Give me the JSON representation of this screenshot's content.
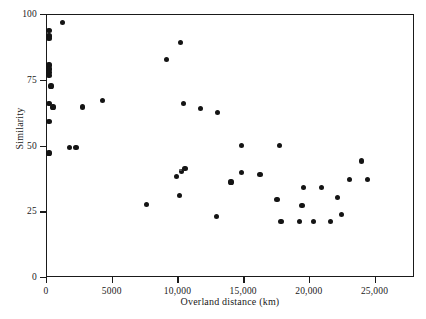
{
  "chart_data": {
    "type": "scatter",
    "title": "",
    "xlabel": "Overland distance (km)",
    "ylabel": "Similarity",
    "xlim": [
      0,
      28000
    ],
    "ylim": [
      0,
      100
    ],
    "grid": false,
    "legend": null,
    "xticks": [
      0,
      5000,
      10000,
      15000,
      20000,
      25000
    ],
    "xticklabels": [
      "0",
      "5000",
      "10,000",
      "15,000",
      "20,000",
      "25,000"
    ],
    "yticks": [
      0,
      25,
      50,
      75,
      100
    ],
    "yticklabels": [
      "0",
      "25",
      "50",
      "75",
      "100"
    ],
    "series": [
      {
        "name": "samples",
        "points": [
          [
            150,
            94.0
          ],
          [
            150,
            92.0
          ],
          [
            150,
            91.0
          ],
          [
            1200,
            97.0
          ],
          [
            150,
            81.0
          ],
          [
            150,
            79.5
          ],
          [
            150,
            78.0
          ],
          [
            150,
            77.0
          ],
          [
            300,
            73.0
          ],
          [
            150,
            66.5
          ],
          [
            150,
            59.5
          ],
          [
            450,
            65.0
          ],
          [
            150,
            47.5
          ],
          [
            1700,
            49.5
          ],
          [
            2200,
            49.5
          ],
          [
            2700,
            65.0
          ],
          [
            4200,
            67.5
          ],
          [
            7600,
            28.0
          ],
          [
            9100,
            83.0
          ],
          [
            10150,
            89.5
          ],
          [
            9850,
            38.5
          ],
          [
            10250,
            40.5
          ],
          [
            10500,
            41.5
          ],
          [
            10100,
            31.5
          ],
          [
            10400,
            66.5
          ],
          [
            11700,
            64.5
          ],
          [
            12900,
            23.5
          ],
          [
            13000,
            63.0
          ],
          [
            14000,
            36.5
          ],
          [
            14800,
            50.5
          ],
          [
            14800,
            40.0
          ],
          [
            16200,
            39.5
          ],
          [
            17700,
            50.5
          ],
          [
            17500,
            30.0
          ],
          [
            17800,
            21.5
          ],
          [
            19200,
            21.5
          ],
          [
            19500,
            34.5
          ],
          [
            19400,
            27.5
          ],
          [
            20300,
            21.5
          ],
          [
            20900,
            34.5
          ],
          [
            21600,
            21.5
          ],
          [
            22100,
            30.5
          ],
          [
            22400,
            24.0
          ],
          [
            23900,
            44.5
          ],
          [
            23000,
            37.5
          ],
          [
            24400,
            37.5
          ]
        ],
        "faint_points": [
          [
            10150,
            41.0
          ]
        ]
      }
    ]
  },
  "axes": {
    "x_axis_name": "overland-distance-axis",
    "y_axis_name": "similarity-axis"
  }
}
